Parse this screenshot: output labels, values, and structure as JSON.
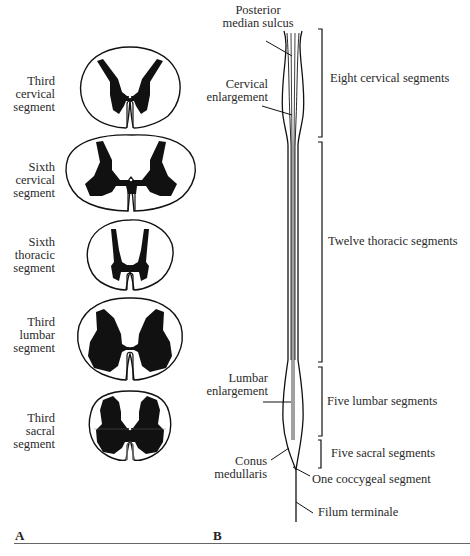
{
  "panel_a": {
    "letter": "A",
    "sections": [
      {
        "line1": "Third",
        "line2": "cervical",
        "line3": "segment"
      },
      {
        "line1": "Sixth",
        "line2": "cervical",
        "line3": "segment"
      },
      {
        "line1": "Sixth",
        "line2": "thoracic",
        "line3": "segment"
      },
      {
        "line1": "Third",
        "line2": "lumbar",
        "line3": "segment"
      },
      {
        "line1": "Third",
        "line2": "sacral",
        "line3": "segment"
      }
    ]
  },
  "panel_b": {
    "letter": "B",
    "left_labels": {
      "posterior_median_sulcus": {
        "line1": "Posterior",
        "line2": "median sulcus"
      },
      "cervical_enlargement": {
        "line1": "Cervical",
        "line2": "enlargement"
      },
      "lumbar_enlargement": {
        "line1": "Lumbar",
        "line2": "enlargement"
      },
      "conus_medullaris": {
        "line1": "Conus",
        "line2": "medullaris"
      }
    },
    "right_labels": {
      "cervical": "Eight cervical segments",
      "thoracic": "Twelve thoracic segments",
      "lumbar": "Five lumbar segments",
      "sacral": "Five sacral segments",
      "coccygeal": "One coccygeal segment",
      "filum": "Filum terminale"
    }
  },
  "colors": {
    "ink": "#111111",
    "text": "#2a2a2a",
    "rule": "#666666",
    "background": "#ffffff"
  }
}
